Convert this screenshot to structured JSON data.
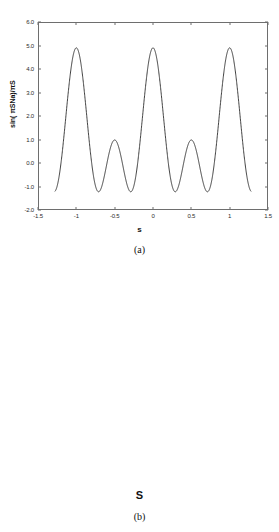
{
  "figure_a": {
    "caption": "(a)",
    "xlabel": "s",
    "ylabel": "sin( πSNa)/πS"
  },
  "figure_b": {
    "caption": "(b)",
    "xlabel": "S",
    "ylabel": ""
  },
  "chart_data": [
    {
      "type": "line",
      "id": "a",
      "title": "",
      "caption": "(a)",
      "xlabel": "s",
      "ylabel": "sin( πSNa)/πS",
      "xlim": [
        -1.5,
        1.5
      ],
      "ylim": [
        -2.0,
        6.0
      ],
      "xticks": [
        -1.5,
        -1,
        -0.5,
        0,
        0.5,
        1,
        1.5
      ],
      "xticklabels": [
        "-1.5",
        "-1",
        "-0.5",
        "0",
        "0.5",
        "1",
        "1.5"
      ],
      "yticks": [
        -2.0,
        -1.0,
        0.0,
        1.0,
        2.0,
        3.0,
        4.0,
        5.0,
        6.0
      ],
      "yticklabels": [
        "-2.0",
        "-1.0",
        "0.0",
        "1.0",
        "2.0",
        "3.0",
        "4.0",
        "5.0",
        "6.0"
      ],
      "grid": false,
      "legend": null,
      "line_color": "#2b2b2b",
      "function": "dirichlet",
      "N": 5,
      "peak_value": 4.9,
      "x_data_range": [
        -1.28,
        1.28
      ],
      "series": [
        {
          "name": "sin(pi*S*N*a)/sin(pi*S*a)",
          "x": [
            -1.28,
            -1.24,
            -1.2,
            -1.16,
            -1.12,
            -1.08,
            -1.04,
            -1.0,
            -0.96,
            -0.92,
            -0.88,
            -0.84,
            -0.8,
            -0.76,
            -0.72,
            -0.68,
            -0.64,
            -0.6,
            -0.56,
            -0.52,
            -0.48,
            -0.44,
            -0.4,
            -0.36,
            -0.32,
            -0.28,
            -0.24,
            -0.2,
            -0.16,
            -0.12,
            -0.08,
            -0.04,
            0,
            0.04,
            0.08,
            0.12,
            0.16,
            0.2,
            0.24,
            0.28,
            0.32,
            0.36,
            0.4,
            0.44,
            0.48,
            0.52,
            0.56,
            0.6,
            0.64,
            0.68,
            0.72,
            0.76,
            0.8,
            0.84,
            0.88,
            0.92,
            0.96,
            1.0,
            1.04,
            1.08,
            1.12,
            1.16,
            1.2,
            1.24,
            1.28
          ],
          "y": [
            0.18,
            0.0,
            -0.23,
            -0.33,
            -0.26,
            -0.05,
            0.21,
            0.38,
            0.35,
            0.13,
            -0.16,
            -0.38,
            -0.43,
            -0.27,
            0.04,
            0.36,
            0.57,
            0.58,
            0.35,
            -0.06,
            -0.52,
            -0.91,
            -1.09,
            -1.0,
            -0.62,
            0.03,
            0.88,
            1.83,
            2.78,
            3.6,
            4.4,
            4.8,
            4.9,
            4.8,
            4.4,
            3.6,
            2.78,
            1.83,
            0.88,
            0.03,
            -0.62,
            -1.0,
            -1.09,
            -0.91,
            -0.52,
            -0.06,
            0.35,
            0.58,
            0.57,
            0.36,
            0.04,
            -0.27,
            -0.43,
            -0.38,
            -0.16,
            0.13,
            0.35,
            0.38,
            0.21,
            -0.05,
            -0.26,
            -0.33,
            -0.23,
            0.0,
            0.18
          ]
        }
      ]
    },
    {
      "type": "line",
      "id": "b",
      "title": "",
      "caption": "(b)",
      "xlabel": "S",
      "ylabel": "",
      "xlim": [
        -1.5,
        1.5
      ],
      "ylim": [
        -4.0,
        11.0
      ],
      "xticks": [
        -1.5,
        -1,
        -0.5,
        0,
        0.5,
        1,
        1.5
      ],
      "xticklabels": [
        "-1.5",
        "-1",
        "-0.5",
        "0",
        "0.5",
        "1",
        "1.5"
      ],
      "yticks": [
        -4.0,
        -2.0,
        0.0,
        2.0,
        4.0,
        6.0,
        8.0,
        10.0
      ],
      "yticklabels": [
        "-4.0",
        "-2.0",
        "0.0",
        "2.0",
        "4.0",
        "6.0",
        "8.0",
        "10.0"
      ],
      "grid": false,
      "legend": null,
      "line_color": "#2b2b2b",
      "function": "dirichlet",
      "N": 10,
      "peak_value": 9.9,
      "x_data_range": [
        -1.28,
        1.28
      ],
      "series": [
        {
          "name": "sin(pi*S*N*a)/sin(pi*S*a)",
          "x": [
            -1.28,
            -1.24,
            -1.2,
            -1.16,
            -1.12,
            -1.08,
            -1.04,
            -1.0,
            -0.96,
            -0.92,
            -0.88,
            -0.84,
            -0.8,
            -0.76,
            -0.72,
            -0.68,
            -0.64,
            -0.6,
            -0.56,
            -0.52,
            -0.48,
            -0.44,
            -0.4,
            -0.36,
            -0.32,
            -0.28,
            -0.24,
            -0.2,
            -0.16,
            -0.12,
            -0.08,
            -0.04,
            0,
            0.04,
            0.08,
            0.12,
            0.16,
            0.2,
            0.24,
            0.28,
            0.32,
            0.36,
            0.4,
            0.44,
            0.48,
            0.52,
            0.56,
            0.6,
            0.64,
            0.68,
            0.72,
            0.76,
            0.8,
            0.84,
            0.88,
            0.92,
            0.96,
            1.0,
            1.04,
            1.08,
            1.12,
            1.16,
            1.2,
            1.24,
            1.28
          ],
          "y": [
            0.1,
            -0.3,
            -0.6,
            -0.4,
            0.15,
            0.55,
            0.45,
            0.0,
            -0.45,
            -0.62,
            -0.35,
            0.2,
            0.62,
            0.6,
            0.1,
            -0.45,
            -0.72,
            -0.5,
            0.1,
            0.65,
            0.8,
            0.4,
            -0.3,
            -0.88,
            -0.9,
            -0.3,
            0.6,
            1.2,
            0.95,
            -0.3,
            -2.1,
            -2.2,
            9.9,
            -2.2,
            -2.1,
            -0.3,
            0.95,
            1.2,
            0.6,
            -0.3,
            -0.9,
            -0.88,
            -0.3,
            0.4,
            0.8,
            0.65,
            0.1,
            -0.5,
            -0.72,
            -0.45,
            0.1,
            0.6,
            0.62,
            0.2,
            -0.35,
            -0.62,
            -0.45,
            0.0,
            0.45,
            0.55,
            0.15,
            -0.4,
            -0.6,
            -0.3,
            0.1
          ]
        }
      ]
    }
  ]
}
